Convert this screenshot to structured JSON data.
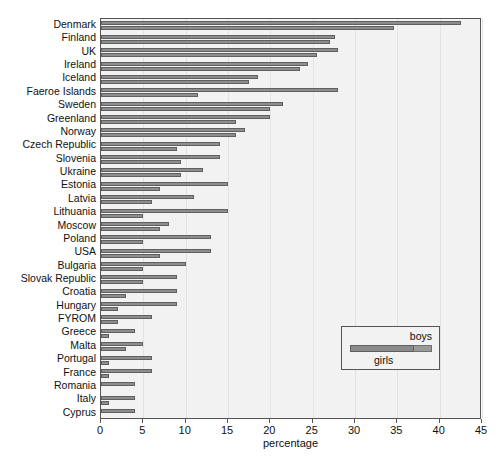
{
  "chart_data": {
    "type": "bar",
    "orientation": "horizontal",
    "title": "",
    "xlabel": "percentage",
    "ylabel": "",
    "xlim": [
      0,
      45
    ],
    "xticks": [
      0,
      5,
      10,
      15,
      20,
      25,
      30,
      35,
      40,
      45
    ],
    "grid": true,
    "legend": {
      "position": "lower right",
      "entries": [
        "boys",
        "girls"
      ]
    },
    "categories": [
      "Denmark",
      "Finland",
      "UK",
      "Ireland",
      "Iceland",
      "Faeroe Islands",
      "Sweden",
      "Greenland",
      "Norway",
      "Czech Republic",
      "Slovenia",
      "Ukraine",
      "Estonia",
      "Latvia",
      "Lithuania",
      "Moscow",
      "Poland",
      "USA",
      "Bulgaria",
      "Slovak Republic",
      "Croatia",
      "Hungary",
      "FYROM",
      "Greece",
      "Malta",
      "Portugal",
      "France",
      "Romania",
      "Italy",
      "Cyprus"
    ],
    "series": [
      {
        "name": "boys",
        "color": "#8d8d8d",
        "values": [
          42.5,
          27.6,
          28.0,
          24.5,
          18.5,
          28.0,
          21.5,
          20.0,
          17.0,
          14.0,
          14.0,
          12.0,
          15.0,
          11.0,
          15.0,
          8.0,
          13.0,
          13.0,
          10.0,
          9.0,
          9.0,
          9.0,
          6.0,
          4.0,
          5.0,
          6.0,
          6.0,
          4.0,
          4.0,
          4.0
        ]
      },
      {
        "name": "girls",
        "color": "#8d8d8d",
        "values": [
          34.6,
          27.0,
          25.5,
          23.5,
          17.5,
          11.5,
          20.0,
          16.0,
          16.0,
          9.0,
          9.5,
          9.5,
          7.0,
          6.0,
          5.0,
          7.0,
          5.0,
          7.0,
          5.0,
          5.0,
          3.0,
          2.0,
          2.0,
          1.0,
          3.0,
          1.0,
          1.0,
          0.0,
          1.0,
          0.0
        ]
      }
    ]
  },
  "axis": {
    "x_label": "percentage",
    "tick_labels": [
      "0",
      "5",
      "10",
      "15",
      "20",
      "25",
      "30",
      "35",
      "40",
      "45"
    ]
  },
  "legend": {
    "boys_label": "boys",
    "girls_label": "girls"
  },
  "colors": {
    "bar_fill": "#8d8d8d",
    "bar_edge": "#606060",
    "plot_background": "#f2f2f2",
    "frame": "#555555",
    "gridline": "#e2e2e2"
  }
}
